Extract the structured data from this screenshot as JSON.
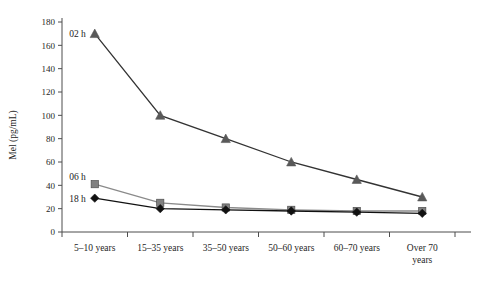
{
  "chart_data": {
    "type": "line",
    "title": "",
    "xlabel": "",
    "ylabel": "Mel (pg/mL)",
    "categories": [
      "5–10 years",
      "15–35 years",
      "35–50 years",
      "50–60 years",
      "60–70 years",
      "Over 70 years"
    ],
    "category_lines": [
      [
        "5–10 years"
      ],
      [
        "15–35 years"
      ],
      [
        "35–50 years"
      ],
      [
        "50–60 years"
      ],
      [
        "60–70 years"
      ],
      [
        "Over 70",
        "years"
      ]
    ],
    "series": [
      {
        "name": "02 h",
        "marker": "triangle",
        "color": "#595959",
        "line_color": "#333333",
        "values": [
          170,
          100,
          80,
          60,
          45,
          30
        ]
      },
      {
        "name": "06 h",
        "marker": "square",
        "color": "#808080",
        "line_color": "#8a8a8a",
        "values": [
          41,
          25,
          21,
          19,
          18,
          18
        ]
      },
      {
        "name": "18 h",
        "marker": "diamond",
        "color": "#111111",
        "line_color": "#111111",
        "values": [
          29,
          20,
          19,
          18,
          17,
          16
        ]
      }
    ],
    "ylim": [
      0,
      180
    ],
    "yticks": [
      0,
      20,
      40,
      60,
      80,
      100,
      120,
      140,
      160,
      180
    ],
    "ytick_labels": [
      "0",
      "20",
      "40",
      "60",
      "80",
      "100",
      "120",
      "140",
      "160",
      "180"
    ],
    "grid": false,
    "legend": "inline-labels",
    "legend_entries": [
      "02 h",
      "06 h",
      "18 h"
    ],
    "background_color": "#ffffff",
    "axis_color": "#4d4d4d"
  }
}
